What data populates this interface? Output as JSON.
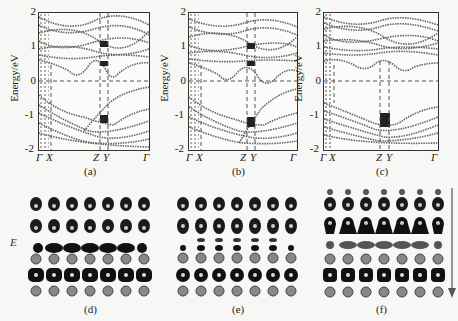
{
  "figure": {
    "panels_top": [
      {
        "id": "a",
        "caption": "(a)",
        "ylabel": "Energy/eV",
        "yticks": [
          "2",
          "1",
          "0",
          "-1",
          "-2"
        ],
        "xticks": [
          "Γ",
          "X",
          "Z",
          "Y",
          "Γ"
        ],
        "gap_hint": "VBM near Γ (≈0), CBM ≈0.1 eV"
      },
      {
        "id": "b",
        "caption": "(b)",
        "ylabel": "Energy/eV",
        "yticks": [
          "2",
          "1",
          "0",
          "-1",
          "-2"
        ],
        "xticks": [
          "Γ",
          "X",
          "Z",
          "Y",
          "Γ"
        ],
        "gap_hint": "CBM ≈0.3 eV, VBM ≈-0.2 eV"
      },
      {
        "id": "c",
        "caption": "(c)",
        "ylabel": "Energy/eV",
        "yticks": [
          "2",
          "1",
          "0",
          "-1",
          "-2"
        ],
        "xticks": [
          "Γ",
          "X",
          "Z",
          "Y",
          "Γ"
        ],
        "gap_hint": "CBM ≈0.5 eV, VBM ≈-0.4 eV"
      }
    ],
    "panels_bottom": [
      {
        "id": "d",
        "caption": "(d)",
        "side_label": "E"
      },
      {
        "id": "e",
        "caption": "(e)"
      },
      {
        "id": "f",
        "caption": "(f)",
        "arrow": "down"
      }
    ],
    "axis": {
      "ymin": -2,
      "ymax": 2,
      "fermi_level": 0
    }
  }
}
